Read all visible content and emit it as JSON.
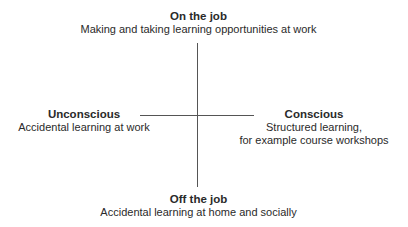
{
  "diagram": {
    "top": {
      "title": "On the job",
      "desc": "Making and taking learning opportunities at work"
    },
    "left": {
      "title": "Unconscious",
      "desc": "Accidental learning at work"
    },
    "right": {
      "title": "Conscious",
      "desc_line1": "Structured learning,",
      "desc_line2": "for example course workshops"
    },
    "bottom": {
      "title": "Off the job",
      "desc": "Accidental learning at home and socially"
    }
  }
}
